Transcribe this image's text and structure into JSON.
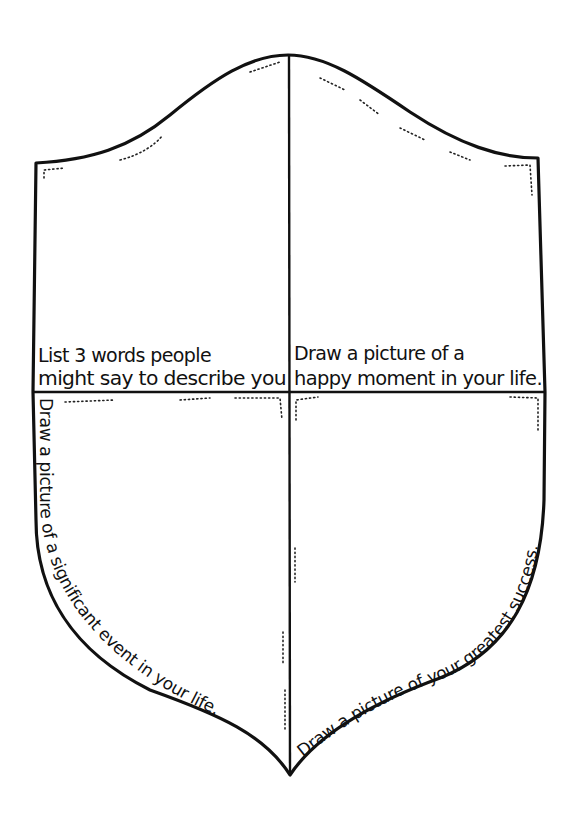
{
  "quadrants": {
    "top_left": {
      "line1": "List 3 words people",
      "line2": "might say to describe you"
    },
    "top_right": {
      "line1": "Draw a picture of a",
      "line2": "happy moment in your life."
    },
    "bottom_left": {
      "curved_text": "Draw a picture of a significant event in your life."
    },
    "bottom_right": {
      "curved_text": "Draw a picture of your greatest success."
    }
  },
  "colors": {
    "ink": "#111111",
    "paper": "#ffffff"
  }
}
